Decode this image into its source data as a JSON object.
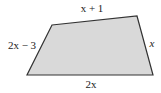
{
  "figure": {
    "shape": "quadrilateral",
    "fill_color": "#d9d9d9",
    "stroke_color": "#333333",
    "vertices": [
      [
        52,
        25
      ],
      [
        137,
        16
      ],
      [
        153,
        75
      ],
      [
        27,
        75
      ]
    ],
    "labels": {
      "top": "x + 1",
      "left": "2x − 3",
      "right": "x",
      "bottom": "2x"
    }
  }
}
